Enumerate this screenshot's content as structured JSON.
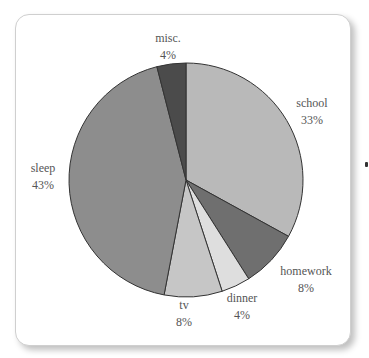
{
  "chart_data": {
    "type": "pie",
    "title": "",
    "categories": [
      "school",
      "homework",
      "dinner",
      "tv",
      "sleep",
      "misc."
    ],
    "values": [
      33,
      8,
      4,
      8,
      43,
      4
    ],
    "labels": [
      {
        "name": "school",
        "pct": "33%"
      },
      {
        "name": "homework",
        "pct": "8%"
      },
      {
        "name": "dinner",
        "pct": "4%"
      },
      {
        "name": "tv",
        "pct": "8%"
      },
      {
        "name": "sleep",
        "pct": "43%"
      },
      {
        "name": "misc.",
        "pct": "4%"
      }
    ],
    "colors": [
      "#b9b9b9",
      "#6f6f6f",
      "#dedede",
      "#c6c6c6",
      "#8d8d8d",
      "#4b4b4b"
    ],
    "start_angle_deg": 0,
    "direction": "clockwise",
    "legend": "none (inline labels)"
  }
}
